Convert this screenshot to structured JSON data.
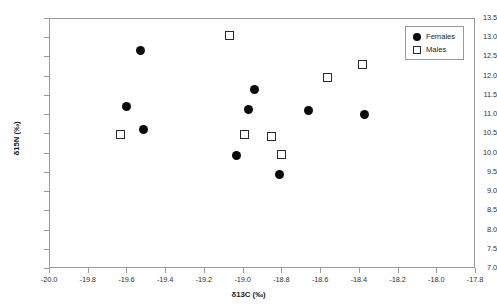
{
  "chart_data": {
    "type": "scatter",
    "title": "",
    "xlabel": "δ13C (‰)",
    "ylabel": "δ15N (‰)",
    "xlim": [
      -20.0,
      -17.8
    ],
    "ylim": [
      7.0,
      13.5
    ],
    "xticks": [
      "-20.0",
      "-19.8",
      "-19.6",
      "-19.4",
      "-19.2",
      "-19.0",
      "-18.8",
      "-18.6",
      "-18.4",
      "-18.2",
      "-18.0",
      "-17.8"
    ],
    "xtick_values": [
      -20.0,
      -19.8,
      -19.6,
      -19.4,
      -19.2,
      -19.0,
      -18.8,
      -18.6,
      -18.4,
      -18.2,
      -18.0,
      -17.8
    ],
    "yticks": [
      "7.0",
      "7.5",
      "8.0",
      "8.5",
      "9.0",
      "9.5",
      "10.0",
      "10.5",
      "11.0",
      "11.5",
      "12.0",
      "12.5",
      "13.0",
      "13.5"
    ],
    "ytick_values": [
      7.0,
      7.5,
      8.0,
      8.5,
      9.0,
      9.5,
      10.0,
      10.5,
      11.0,
      11.5,
      12.0,
      12.5,
      13.0,
      13.5
    ],
    "grid": false,
    "legend_position": "top-right",
    "legend_entries": [
      "Females",
      "Males"
    ],
    "marker_colors": {
      "females": "#0a0a0a",
      "males": "#2a2a2a"
    },
    "frame_color": "#9a9a9a",
    "series": [
      {
        "name": "Females",
        "marker": "filled-circle",
        "points": [
          {
            "x": -19.53,
            "y": 12.65
          },
          {
            "x": -19.6,
            "y": 11.2
          },
          {
            "x": -19.51,
            "y": 10.61
          },
          {
            "x": -19.03,
            "y": 9.92
          },
          {
            "x": -18.97,
            "y": 11.11
          },
          {
            "x": -18.94,
            "y": 11.65
          },
          {
            "x": -18.81,
            "y": 9.42
          },
          {
            "x": -18.66,
            "y": 11.09
          },
          {
            "x": -18.37,
            "y": 10.98
          }
        ]
      },
      {
        "name": "Males",
        "marker": "open-square",
        "points": [
          {
            "x": -19.63,
            "y": 10.46
          },
          {
            "x": -19.07,
            "y": 13.04
          },
          {
            "x": -18.99,
            "y": 10.48
          },
          {
            "x": -18.85,
            "y": 10.41
          },
          {
            "x": -18.8,
            "y": 9.95
          },
          {
            "x": -18.56,
            "y": 11.95
          },
          {
            "x": -18.38,
            "y": 12.3
          }
        ]
      }
    ]
  }
}
